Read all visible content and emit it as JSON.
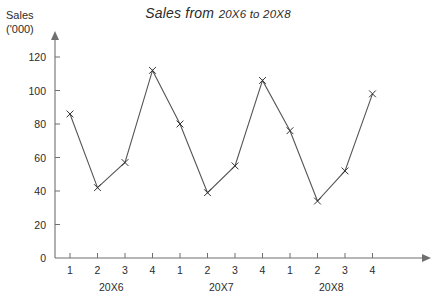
{
  "chart_data": {
    "type": "line",
    "title": "Sales from 20X6 to 20X8",
    "title_main": "Sales from",
    "title_sub": "20X6 to 20X8",
    "ylabel_line1": "Sales",
    "ylabel_line2": "('000)",
    "xlabel": "",
    "ylim": [
      0,
      130
    ],
    "yticks": [
      0,
      20,
      40,
      60,
      80,
      100,
      120
    ],
    "grid": false,
    "legend": "none",
    "marker": "x",
    "categories": [
      "1",
      "2",
      "3",
      "4",
      "1",
      "2",
      "3",
      "4",
      "1",
      "2",
      "3",
      "4"
    ],
    "group_labels": [
      "20X6",
      "20X7",
      "20X8"
    ],
    "values": [
      86,
      42,
      57,
      112,
      80,
      39,
      55,
      106,
      76,
      34,
      52,
      98
    ],
    "series": [
      {
        "name": "Sales",
        "values": [
          86,
          42,
          57,
          112,
          80,
          39,
          55,
          106,
          76,
          34,
          52,
          98
        ]
      }
    ]
  }
}
